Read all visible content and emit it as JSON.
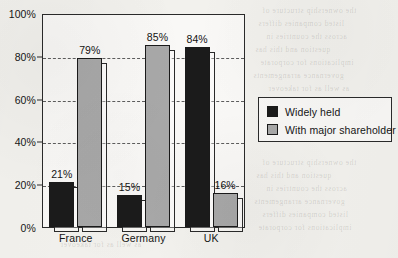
{
  "chart_data": {
    "type": "bar",
    "title": "",
    "subtitle": "",
    "xlabel": "",
    "ylabel": "",
    "categories": [
      "France",
      "Germany",
      "UK"
    ],
    "series": [
      {
        "name": "Widely held",
        "color": "#1b1b1b",
        "values": [
          21,
          15,
          84
        ],
        "value_labels": [
          "21%",
          "15%",
          "84%"
        ]
      },
      {
        "name": "With major shareholder",
        "color": "#a8a8a8",
        "values": [
          79,
          85,
          16
        ],
        "value_labels": [
          "79%",
          "85%",
          "16%"
        ]
      }
    ],
    "ylim": [
      0,
      100
    ],
    "yticks": [
      0,
      20,
      40,
      60,
      80,
      100
    ],
    "ytick_labels": [
      "0%",
      "20%",
      "40%",
      "60%",
      "80%",
      "100%"
    ],
    "grid": true,
    "grid_style": "dashed",
    "grid_axis": "y",
    "legend_position": "right",
    "legend_entries": [
      "Widely held",
      "With major shareholder"
    ],
    "bar_style": "3d-offset-shadow",
    "units": "percent"
  },
  "axis": {
    "y_ticks": [
      {
        "label": "100%",
        "value": 100
      },
      {
        "label": "80%",
        "value": 80
      },
      {
        "label": "60%",
        "value": 60
      },
      {
        "label": "40%",
        "value": 40
      },
      {
        "label": "20%",
        "value": 20
      },
      {
        "label": "0%",
        "value": 0
      }
    ],
    "x_categories": [
      "France",
      "Germany",
      "UK"
    ]
  },
  "legend": {
    "items": [
      {
        "label": "Widely held",
        "color": "#1b1b1b"
      },
      {
        "label": "With major shareholder",
        "color": "#a8a8a8"
      }
    ]
  },
  "bleed_text": {
    "lines": [
      "the ownership structure of",
      "listed companies differs",
      "across the countries in",
      "question and this has",
      "implications for corporate",
      "governance arrangements",
      "as well as for takeover"
    ]
  }
}
